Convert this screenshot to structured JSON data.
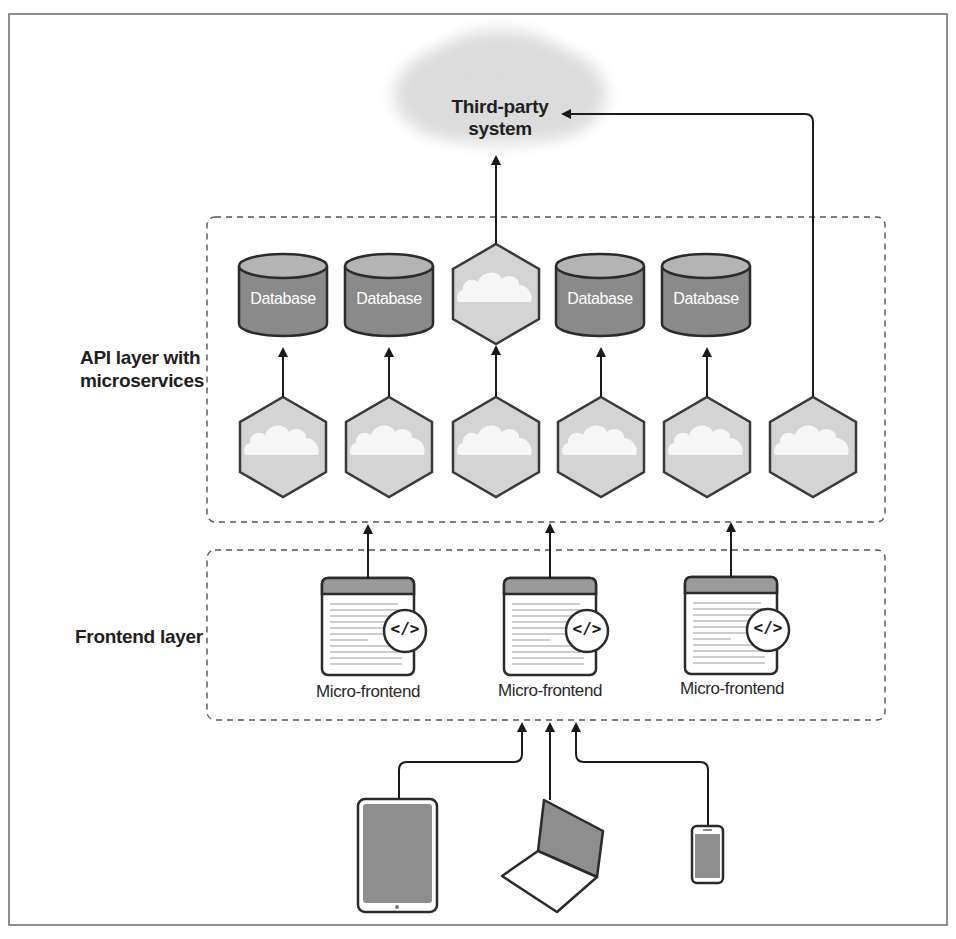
{
  "diagram": {
    "third_party": {
      "line1": "Third-party",
      "line2": "system"
    },
    "layers": {
      "api": {
        "label_line1": "API layer with",
        "label_line2": "microservices"
      },
      "frontend": {
        "label": "Frontend layer"
      }
    },
    "databases": [
      {
        "label": "Database"
      },
      {
        "label": "Database"
      },
      {
        "label": "Database"
      },
      {
        "label": "Database"
      }
    ],
    "microservices_count": 7,
    "micro_frontends": [
      {
        "label": "Micro-frontend",
        "icon": "code-icon",
        "glyph": "</>"
      },
      {
        "label": "Micro-frontend",
        "icon": "code-icon",
        "glyph": "</>"
      },
      {
        "label": "Micro-frontend",
        "icon": "code-icon",
        "glyph": "</>"
      }
    ],
    "devices": [
      {
        "name": "tablet-icon"
      },
      {
        "name": "laptop-icon"
      },
      {
        "name": "smartphone-icon"
      }
    ],
    "colors": {
      "database_fill": "#8a8a8a",
      "database_top": "#b4b4b4",
      "hexagon_fill": "#d4d4d4",
      "cloud_fill": "#f0f0f0",
      "stroke": "#2b2b2b",
      "dashed_border": "#555555"
    }
  }
}
